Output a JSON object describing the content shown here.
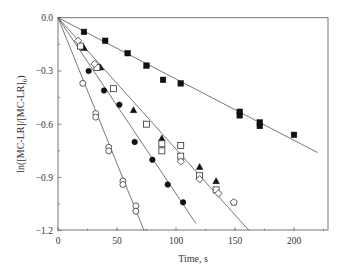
{
  "chart_data": {
    "type": "scatter",
    "title": "",
    "xlabel": "Time, s",
    "ylabel": "ln([MC-LR]/[MC-LR]0)",
    "ylabel_parts": {
      "main": "ln([MC-LR]/[MC-LR]",
      "sub": "0",
      "close": ")"
    },
    "xlim": [
      0,
      225
    ],
    "ylim": [
      -1.2,
      0.0
    ],
    "x_ticks": [
      0,
      50,
      100,
      150,
      200
    ],
    "x_tick_labels": [
      "0",
      "50",
      "100",
      "150",
      "200"
    ],
    "x_minor_ticks": [
      25,
      75,
      125,
      175,
      225
    ],
    "y_ticks": [
      0.0,
      -0.3,
      -0.6,
      -0.9,
      -1.2
    ],
    "y_tick_labels": [
      "0.0",
      "−0.3",
      "−0.6",
      "−0.9",
      "−1.2"
    ],
    "y_minor_ticks": [
      -0.15,
      -0.45,
      -0.75,
      -1.05
    ],
    "grid": false,
    "legend": null,
    "fit_lines": [
      {
        "name": "open-circle-fit",
        "x": [
          0,
          73
        ],
        "y": [
          0,
          -1.2
        ],
        "slope": -0.0164
      },
      {
        "name": "filled-circle-fit",
        "x": [
          0,
          117
        ],
        "y": [
          0,
          -1.16
        ],
        "slope": -0.0099
      },
      {
        "name": "middle-fit",
        "x": [
          0,
          162
        ],
        "y": [
          0,
          -1.2
        ],
        "slope": -0.0074
      },
      {
        "name": "filled-square-fit",
        "x": [
          0,
          220
        ],
        "y": [
          0,
          -0.76
        ],
        "slope": -0.00345
      }
    ],
    "series": [
      {
        "name": "filled squares",
        "marker": "square",
        "filled": true,
        "x": [
          22,
          40,
          59,
          75,
          89,
          104,
          154,
          154,
          171,
          171,
          200
        ],
        "y": [
          -0.08,
          -0.13,
          -0.2,
          -0.27,
          -0.35,
          -0.37,
          -0.53,
          -0.55,
          -0.59,
          -0.61,
          -0.66
        ]
      },
      {
        "name": "open circles",
        "marker": "circle",
        "filled": false,
        "x": [
          21,
          32,
          32,
          43,
          43,
          55,
          55,
          66,
          66
        ],
        "y": [
          -0.37,
          -0.54,
          -0.56,
          -0.73,
          -0.75,
          -0.92,
          -0.94,
          -1.06,
          -1.09
        ]
      },
      {
        "name": "filled circles",
        "marker": "circle",
        "filled": true,
        "x": [
          26,
          39,
          52,
          65,
          80,
          93,
          106
        ],
        "y": [
          -0.3,
          -0.41,
          -0.49,
          -0.7,
          -0.8,
          -0.94,
          -1.04
        ]
      },
      {
        "name": "filled triangles",
        "marker": "triangle",
        "filled": true,
        "x": [
          22,
          36,
          64,
          88,
          120,
          134
        ],
        "y": [
          -0.17,
          -0.28,
          -0.52,
          -0.68,
          -0.84,
          -0.92
        ]
      },
      {
        "name": "open squares",
        "marker": "square",
        "filled": false,
        "x": [
          19,
          33,
          47,
          75,
          88,
          88,
          104,
          104,
          120,
          134
        ],
        "y": [
          -0.16,
          -0.28,
          -0.4,
          -0.6,
          -0.71,
          -0.75,
          -0.72,
          -0.78,
          -0.89,
          -0.97
        ]
      },
      {
        "name": "open diamonds",
        "marker": "diamond",
        "filled": false,
        "x": [
          17,
          31,
          104,
          120,
          136
        ],
        "y": [
          -0.13,
          -0.26,
          -0.81,
          -0.91,
          -0.99
        ]
      },
      {
        "name": "open pentagon",
        "marker": "pentagon",
        "filled": false,
        "x": [
          149
        ],
        "y": [
          -1.04
        ]
      }
    ]
  }
}
